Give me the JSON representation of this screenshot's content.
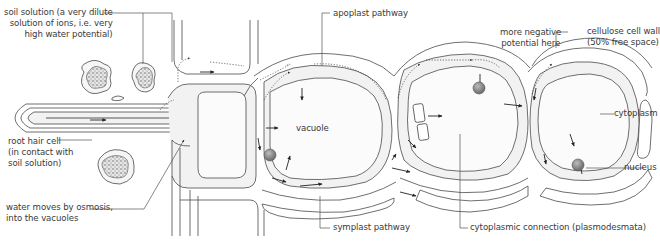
{
  "diagram": {
    "labels": {
      "soil_solution": [
        "soil solution (a very dilute",
        "solution of ions, i.e. very",
        "high water potential)"
      ],
      "root_hair_cell": [
        "root hair cell",
        "(in contact with",
        "soil solution)"
      ],
      "osmosis": [
        "water moves by osmosis,",
        "into the vacuoles"
      ],
      "apoplast": "apoplast pathway",
      "symplast": "symplast pathway",
      "vacuole": "vacuole",
      "more_negative": [
        "more negative",
        "potential here"
      ],
      "cell_wall": [
        "cellulose cell wall",
        "(50% free space)"
      ],
      "cytoplasm": "cytoplasm",
      "nucleus": "nucleus",
      "plasmodesmata": "cytoplasmic connection (plasmodesmata)"
    },
    "colors": {
      "line": "#4a4a4a",
      "cytoplasm_fill": "#f2f2f2",
      "vacuole_fill": "#fbfbfb",
      "nucleus_fill": "#8a8a8a",
      "text": "#3a3a3a"
    }
  }
}
